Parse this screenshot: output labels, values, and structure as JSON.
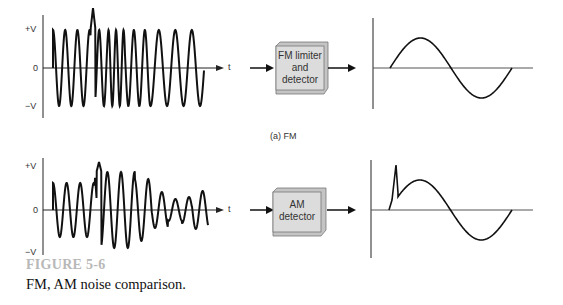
{
  "fm_panel": {
    "y_labels": {
      "pos": "+V",
      "zero": "0",
      "neg": "−V"
    },
    "x_label": "t",
    "block_label_lines": [
      "FM limiter",
      "and",
      "detector"
    ],
    "panel_caption": "(a) FM"
  },
  "am_panel": {
    "y_labels": {
      "pos": "+V",
      "zero": "0",
      "neg": "−V"
    },
    "x_label": "t",
    "block_label_lines": [
      "AM",
      "detector"
    ]
  },
  "figure": {
    "number": "FIGURE 5-6",
    "caption": "FM, AM noise comparison."
  },
  "colors": {
    "line": "#111111",
    "block_face": "#dcdcdc",
    "block_side": "#c4c4c4",
    "figure_number": "#b8b8b8"
  }
}
